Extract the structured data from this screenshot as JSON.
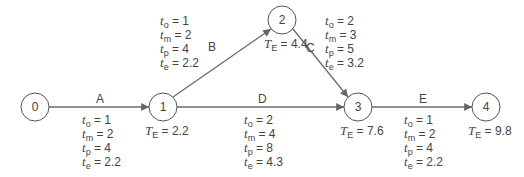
{
  "nodes": [
    {
      "id": "0",
      "label": "0",
      "te": null
    },
    {
      "id": "1",
      "label": "1",
      "te": "2.2"
    },
    {
      "id": "2",
      "label": "2",
      "te": "4.4"
    },
    {
      "id": "3",
      "label": "3",
      "te": "7.6"
    },
    {
      "id": "4",
      "label": "4",
      "te": "9.8"
    }
  ],
  "activities": [
    {
      "name": "A",
      "from": "0",
      "to": "1",
      "to_v": "1",
      "tm_v": "2",
      "tp_v": "4",
      "te_v": "2.2"
    },
    {
      "name": "B",
      "from": "1",
      "to": "2",
      "to_v": "1",
      "tm_v": "2",
      "tp_v": "4",
      "te_v": "2.2"
    },
    {
      "name": "C",
      "from": "2",
      "to": "3",
      "to_v": "2",
      "tm_v": "3",
      "tp_v": "5",
      "te_v": "3.2"
    },
    {
      "name": "D",
      "from": "1",
      "to": "3",
      "to_v": "2",
      "tm_v": "4",
      "tp_v": "8",
      "te_v": "4.3"
    },
    {
      "name": "E",
      "from": "3",
      "to": "4",
      "to_v": "1",
      "tm_v": "2",
      "tp_v": "4",
      "te_v": "2.2"
    }
  ],
  "labels": {
    "TE_prefix": "T",
    "TE_sub": "E",
    "eq": " = ",
    "t": "t",
    "sub_o": "o",
    "sub_m": "m",
    "sub_p": "p",
    "sub_e": "e"
  },
  "colors": {
    "line": "#6b6b6b",
    "node_stroke": "#555555",
    "text": "#444444"
  }
}
